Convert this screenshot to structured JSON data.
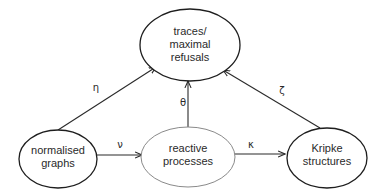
{
  "diagram": {
    "nodes": [
      {
        "id": "traces",
        "lines": [
          "traces/",
          "maximal",
          "refusals"
        ]
      },
      {
        "id": "graphs",
        "lines": [
          "normalised",
          "graphs"
        ]
      },
      {
        "id": "processes",
        "lines": [
          "reactive",
          "processes"
        ]
      },
      {
        "id": "kripke",
        "lines": [
          "Kripke",
          "structures"
        ]
      }
    ],
    "edges": [
      {
        "from": "graphs",
        "to": "traces",
        "label": "η"
      },
      {
        "from": "processes",
        "to": "traces",
        "label": "θ"
      },
      {
        "from": "kripke",
        "to": "traces",
        "label": "ζ"
      },
      {
        "from": "graphs",
        "to": "processes",
        "label": "ν"
      },
      {
        "from": "processes",
        "to": "kripke",
        "label": "κ"
      }
    ],
    "colors": {
      "stroke": "#1e1e1e",
      "light_stroke": "#8a8a8a",
      "text": "#2a2a2a",
      "background": "#ffffff"
    }
  }
}
